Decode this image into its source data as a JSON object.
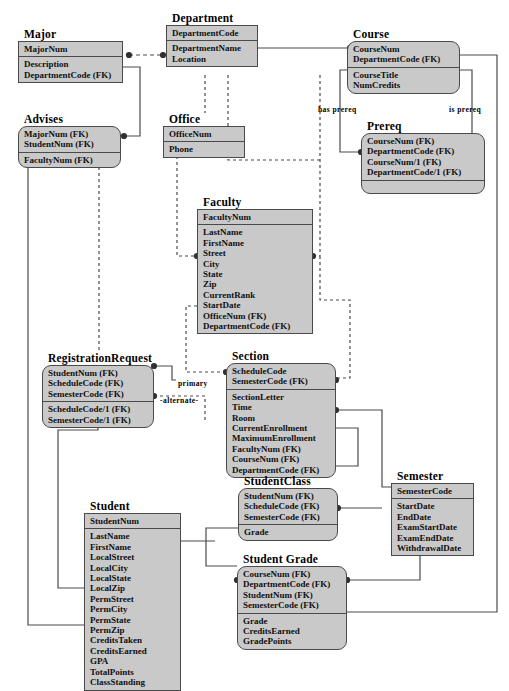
{
  "diagram": {
    "fill_color": "#c9c9c9",
    "line_color": "#4a4a4a",
    "entities": [
      {
        "id": "major",
        "name": "Major",
        "shape": "rect",
        "x": 18,
        "y": 28,
        "w": 105,
        "primary": [
          "MajorNum"
        ],
        "attributes": [
          "Description",
          "DepartmentCode (FK)"
        ]
      },
      {
        "id": "department",
        "name": "Department",
        "shape": "rect",
        "x": 166,
        "y": 12,
        "w": 92,
        "primary": [
          "DepartmentCode"
        ],
        "attributes": [
          "DepartmentName",
          "Location"
        ]
      },
      {
        "id": "course",
        "name": "Course",
        "shape": "rounded",
        "x": 347,
        "y": 28,
        "w": 113,
        "primary": [
          "CourseNum",
          "DepartmentCode (FK)"
        ],
        "attributes": [
          "CourseTitle",
          "NumCredits"
        ]
      },
      {
        "id": "advises",
        "name": "Advises",
        "shape": "rounded",
        "x": 18,
        "y": 113,
        "w": 103,
        "primary": [
          "MajorNum (FK)",
          "StudentNum (FK)"
        ],
        "attributes": [
          "FacultyNum (FK)"
        ]
      },
      {
        "id": "office",
        "name": "Office",
        "shape": "rect",
        "x": 163,
        "y": 113,
        "w": 82,
        "primary": [
          "OfficeNum"
        ],
        "attributes": [
          "Phone"
        ]
      },
      {
        "id": "prereq",
        "name": "Prereq",
        "shape": "rounded",
        "x": 361,
        "y": 120,
        "w": 124,
        "primary": [
          "CourseNum (FK)",
          "DepartmentCode (FK)",
          "CourseNum/1 (FK)",
          "DepartmentCode/1 (FK)"
        ],
        "attributes": []
      },
      {
        "id": "faculty",
        "name": "Faculty",
        "shape": "rect",
        "x": 197,
        "y": 196,
        "w": 116,
        "primary": [
          "FacultyNum"
        ],
        "attributes": [
          "LastName",
          "FirstName",
          "Street",
          "City",
          "State",
          "Zip",
          "CurrentRank",
          "StartDate",
          "OfficeNum (FK)",
          "DepartmentCode (FK)"
        ]
      },
      {
        "id": "registrationrequest",
        "name": "RegistrationRequest",
        "shape": "rounded",
        "x": 42,
        "y": 352,
        "w": 112,
        "primary": [
          "StudentNum (FK)",
          "ScheduleCode (FK)",
          "SemesterCode (FK)"
        ],
        "attributes": [
          "ScheduleCode/1 (FK)",
          "SemesterCode/1 (FK)"
        ]
      },
      {
        "id": "section",
        "name": "Section",
        "shape": "rounded",
        "x": 226,
        "y": 350,
        "w": 110,
        "primary": [
          "ScheduleCode",
          "SemesterCode (FK)"
        ],
        "attributes": [
          "SectionLetter",
          "Time",
          "Room",
          "CurrentEnrollment",
          "MaximumEnrollment",
          "FacultyNum (FK)",
          "CourseNum (FK)",
          "DepartmentCode (FK)"
        ]
      },
      {
        "id": "studentclass",
        "name": "StudentClass",
        "shape": "rounded",
        "x": 238,
        "y": 475,
        "w": 100,
        "primary": [
          "StudentNum (FK)",
          "ScheduleCode (FK)",
          "SemesterCode (FK)"
        ],
        "attributes": [
          "Grade"
        ]
      },
      {
        "id": "semester",
        "name": "Semester",
        "shape": "rect",
        "x": 391,
        "y": 470,
        "w": 83,
        "primary": [
          "SemesterCode"
        ],
        "attributes": [
          "StartDate",
          "EndDate",
          "ExamStartDate",
          "ExamEndDate",
          "WithdrawalDate"
        ]
      },
      {
        "id": "student",
        "name": "Student",
        "shape": "rect",
        "x": 84,
        "y": 500,
        "w": 97,
        "primary": [
          "StudentNum"
        ],
        "attributes": [
          "LastName",
          "FirstName",
          "LocalStreet",
          "LocalCity",
          "LocalState",
          "LocalZip",
          "PermStreet",
          "PermCity",
          "PermState",
          "PermZip",
          "CreditsTaken",
          "CreditsEarned",
          "GPA",
          "TotalPoints",
          "ClassStanding"
        ]
      },
      {
        "id": "studentgrade",
        "name": "Student Grade",
        "shape": "rounded",
        "x": 237,
        "y": 553,
        "w": 110,
        "primary": [
          "CourseNum (FK)",
          "DepartmentCode (FK)",
          "StudentNum (FK)",
          "SemesterCode (FK)"
        ],
        "attributes": [
          "Grade",
          "CreditsEarned",
          "GradePoints"
        ]
      }
    ],
    "relationship_labels": [
      {
        "id": "has-prereq",
        "text": "has  prereq",
        "x": 318,
        "y": 105
      },
      {
        "id": "is-prereq",
        "text": "is  prereq",
        "x": 449,
        "y": 105
      },
      {
        "id": "primary",
        "text": "primary",
        "x": 178,
        "y": 379
      },
      {
        "id": "alternate",
        "text": "-alternate-",
        "x": 160,
        "y": 396
      }
    ]
  }
}
